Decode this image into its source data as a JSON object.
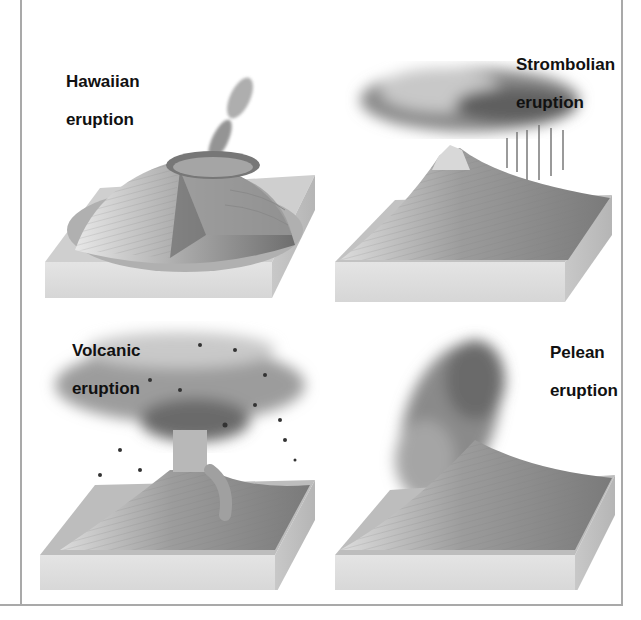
{
  "figure": {
    "panels": [
      {
        "id": "hawaiian",
        "label_line1": "Hawaiian",
        "label_line2": "eruption"
      },
      {
        "id": "strombolian",
        "label_line1": "Strombolian",
        "label_line2": "eruption"
      },
      {
        "id": "volcanic",
        "label_line1": "Volcanic",
        "label_line2": "eruption"
      },
      {
        "id": "pelean",
        "label_line1": "Pelean",
        "label_line2": "eruption"
      }
    ]
  },
  "colors": {
    "frame": "#a9a9a9",
    "label": "#111111",
    "block_side": "#dcdcdc",
    "block_top": "#bdbdbd",
    "cone": "#9a9a9a",
    "cloud": "#7a7a7a"
  }
}
